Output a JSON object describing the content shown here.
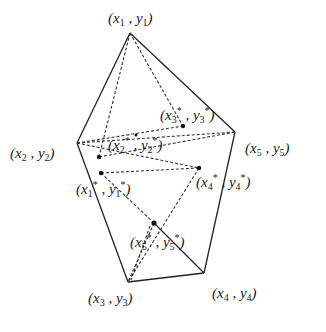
{
  "diagram": {
    "vertices": [
      {
        "id": "p1",
        "label": "x1, y1",
        "x": 130,
        "y": 33
      },
      {
        "id": "p2",
        "label": "x2, y2",
        "x": 77,
        "y": 143
      },
      {
        "id": "p3",
        "label": "x3, y3",
        "x": 128,
        "y": 282
      },
      {
        "id": "p4",
        "label": "x4, y4",
        "x": 204,
        "y": 273
      },
      {
        "id": "p5",
        "label": "x5, y5",
        "x": 235,
        "y": 132
      }
    ],
    "starred_points": [
      {
        "id": "s1",
        "label": "x1*, y1*",
        "x": 101,
        "y": 173
      },
      {
        "id": "s2",
        "label": "x2*, y2*",
        "x": 99,
        "y": 157
      },
      {
        "id": "s3",
        "label": "x3*, y3*",
        "x": 183,
        "y": 126
      },
      {
        "id": "s4",
        "label": "x4*, y4*",
        "x": 199,
        "y": 168
      },
      {
        "id": "s5",
        "label": "x5*, y5*",
        "x": 154,
        "y": 223
      }
    ],
    "labels": {
      "p1": [
        "(",
        "x",
        "1",
        " , ",
        "y",
        "1",
        ")"
      ],
      "p2": [
        "(",
        "x",
        "2",
        " , ",
        "y",
        "2",
        ")"
      ],
      "p3": [
        "(",
        "x",
        "3",
        " , ",
        "y",
        "3",
        ")"
      ],
      "p4": [
        "(",
        "x",
        "4",
        " , ",
        "y",
        "4",
        ")"
      ],
      "p5": [
        "(",
        "x",
        "5",
        " , ",
        "y",
        "5",
        ")"
      ],
      "s1": [
        "(",
        "x",
        "1",
        "*",
        " , ",
        "y",
        "1",
        "*",
        ")"
      ],
      "s2": [
        "(",
        "x",
        "2",
        "*",
        " , ",
        "y",
        "2",
        "*",
        ")"
      ],
      "s3": [
        "(",
        "x",
        "3",
        "*",
        " , ",
        "y",
        "3",
        "*",
        ")"
      ],
      "s4": [
        "(",
        "x",
        "4",
        "*",
        " , ",
        "y",
        "4",
        "*",
        ")"
      ],
      "s5": [
        "(",
        "x",
        "5",
        "*",
        " , ",
        "y",
        "5",
        "*",
        ")"
      ]
    }
  }
}
